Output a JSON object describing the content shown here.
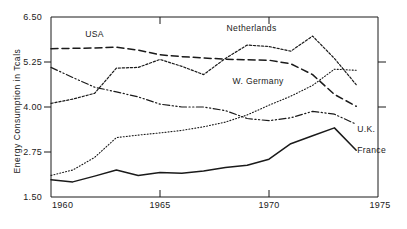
{
  "chart_data": {
    "type": "line",
    "title": "",
    "xlabel": "",
    "ylabel": "Energy Consumption in Tcals",
    "xlim": [
      1960,
      1975
    ],
    "ylim": [
      1.5,
      6.5
    ],
    "xticks": [
      "1960",
      "1965",
      "1970",
      "1975"
    ],
    "xtick_values": [
      1960,
      1965,
      1970,
      1975
    ],
    "yticks": [
      "6.50",
      "5.25",
      "4.00",
      "2.75",
      "1.50"
    ],
    "ytick_values": [
      6.5,
      5.25,
      4.0,
      2.75,
      1.5
    ],
    "grid": false,
    "legend_position": "inline-annotations",
    "x": [
      1960,
      1961,
      1962,
      1963,
      1964,
      1965,
      1966,
      1967,
      1968,
      1969,
      1970,
      1971,
      1972,
      1973,
      1974
    ],
    "series": [
      {
        "name": "USA",
        "label": "USA",
        "linestyle": "long-dash",
        "label_x": 1962.0,
        "label_y": 5.95,
        "values": [
          5.62,
          5.63,
          5.64,
          5.66,
          5.58,
          5.45,
          5.4,
          5.36,
          5.33,
          5.31,
          5.3,
          5.2,
          4.9,
          4.35,
          4.02
        ]
      },
      {
        "name": "Netherlands",
        "label": "Netherlands",
        "linestyle": "dotted-dash",
        "label_x": 1969.2,
        "label_y": 6.1,
        "values": [
          4.1,
          4.22,
          4.38,
          5.08,
          5.1,
          5.32,
          5.13,
          4.9,
          5.35,
          5.72,
          5.68,
          5.55,
          5.97,
          5.35,
          4.62
        ]
      },
      {
        "name": "W. Germany",
        "label": "W. Germany",
        "linestyle": "fine-dotted",
        "label_x": 1969.5,
        "label_y": 4.63,
        "values": [
          2.1,
          2.25,
          2.6,
          3.15,
          3.22,
          3.28,
          3.35,
          3.45,
          3.58,
          3.78,
          4.05,
          4.3,
          4.6,
          5.05,
          5.02
        ]
      },
      {
        "name": "U.K.",
        "label": "U.K.",
        "linestyle": "dash-dot-dot",
        "label_x": 1974.0,
        "label_y": 3.3,
        "values": [
          5.1,
          4.82,
          4.55,
          4.42,
          4.28,
          4.08,
          4.0,
          4.0,
          3.9,
          3.68,
          3.62,
          3.7,
          3.88,
          3.8,
          3.52
        ]
      },
      {
        "name": "France",
        "label": "France",
        "linestyle": "solid",
        "label_x": 1974.0,
        "label_y": 2.72,
        "values": [
          1.98,
          1.92,
          2.08,
          2.25,
          2.1,
          2.18,
          2.16,
          2.22,
          2.32,
          2.38,
          2.55,
          2.98,
          3.2,
          3.42,
          2.8
        ]
      }
    ]
  }
}
